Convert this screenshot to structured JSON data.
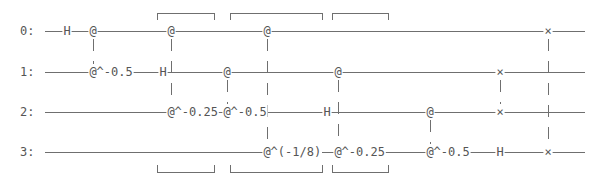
{
  "diagram": {
    "type": "quantum-circuit",
    "qubits": [
      {
        "label": "0:"
      },
      {
        "label": "1:"
      },
      {
        "label": "2:"
      },
      {
        "label": "3:"
      }
    ],
    "moments": [
      {
        "ops": [
          {
            "qubit": 0,
            "text": "H"
          }
        ]
      },
      {
        "ops": [
          {
            "qubit": 0,
            "text": "@"
          },
          {
            "qubit": 1,
            "text": "@^-0.5"
          }
        ],
        "connect": [
          0,
          1
        ]
      },
      {
        "ops": [
          {
            "qubit": 1,
            "text": "H"
          }
        ]
      },
      {
        "ops": [
          {
            "qubit": 0,
            "text": "@"
          },
          {
            "qubit": 2,
            "text": "@^-0.25"
          }
        ],
        "connect": [
          0,
          2
        ]
      },
      {
        "ops": [
          {
            "qubit": 1,
            "text": "@"
          },
          {
            "qubit": 2,
            "text": "@^-0.5"
          }
        ],
        "connect": [
          1,
          2
        ]
      },
      {
        "ops": [
          {
            "qubit": 0,
            "text": "@"
          },
          {
            "qubit": 3,
            "text": "@^(-1/8)"
          }
        ],
        "connect": [
          0,
          3
        ]
      },
      {
        "ops": [
          {
            "qubit": 2,
            "text": "H"
          }
        ]
      },
      {
        "ops": [
          {
            "qubit": 1,
            "text": "@"
          },
          {
            "qubit": 3,
            "text": "@^-0.25"
          }
        ],
        "connect": [
          1,
          3
        ]
      },
      {
        "ops": [
          {
            "qubit": 2,
            "text": "@"
          },
          {
            "qubit": 3,
            "text": "@^-0.5"
          }
        ],
        "connect": [
          2,
          3
        ]
      },
      {
        "ops": [
          {
            "qubit": 1,
            "text": "×"
          },
          {
            "qubit": 2,
            "text": "×"
          },
          {
            "qubit": 3,
            "text": "H"
          }
        ],
        "connect": [
          1,
          2
        ]
      },
      {
        "ops": [
          {
            "qubit": 0,
            "text": "×"
          },
          {
            "qubit": 3,
            "text": "×"
          }
        ],
        "connect": [
          0,
          3
        ]
      }
    ],
    "brackets": [
      {
        "name": "moment-group-1"
      },
      {
        "name": "moment-group-2"
      },
      {
        "name": "moment-group-3"
      }
    ]
  }
}
